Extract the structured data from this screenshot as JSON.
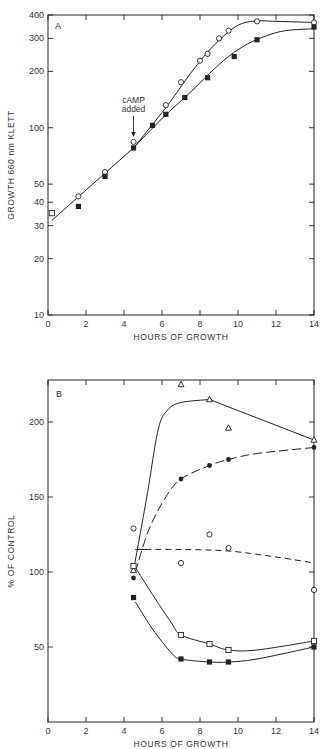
{
  "chart_data": [
    {
      "panel": "A",
      "type": "line",
      "title": "",
      "xlabel": "HOURS OF GROWTH",
      "ylabel": "GROWTH 660 nm KLETT",
      "yscale": "log",
      "xlim": [
        0,
        14
      ],
      "ylim": [
        10,
        400
      ],
      "x_ticks": [
        0,
        2,
        4,
        6,
        8,
        10,
        12,
        14
      ],
      "y_ticks": [
        10,
        20,
        30,
        40,
        50,
        100,
        200,
        300,
        400
      ],
      "grid": false,
      "annotations": [
        {
          "text": "cAMP added",
          "x": 4.5,
          "y": 84,
          "arrow": true
        }
      ],
      "series": [
        {
          "name": "open circles",
          "marker": "open-circle",
          "line": "solid",
          "points": [
            [
              1.6,
              43
            ],
            [
              3,
              58
            ],
            [
              4.5,
              84
            ],
            [
              6.2,
              132
            ],
            [
              7,
              175
            ],
            [
              8,
              228
            ],
            [
              8.4,
              248
            ],
            [
              9,
              300
            ],
            [
              9.5,
              330
            ],
            [
              11,
              370
            ],
            [
              14,
              365
            ]
          ]
        },
        {
          "name": "open square (initial)",
          "marker": "open-square",
          "line": "none",
          "points": [
            [
              0.2,
              35
            ]
          ]
        },
        {
          "name": "filled squares",
          "marker": "filled-square",
          "line": "solid",
          "points": [
            [
              1.6,
              38
            ],
            [
              3,
              55
            ],
            [
              4.5,
              78
            ],
            [
              5.5,
              103
            ],
            [
              6.2,
              118
            ],
            [
              7.2,
              145
            ],
            [
              8.4,
              185
            ],
            [
              9.8,
              240
            ],
            [
              11,
              295
            ],
            [
              14,
              345
            ]
          ]
        }
      ],
      "curves": {
        "shared_start": [
          [
            0.2,
            32
          ],
          [
            4.5,
            78
          ]
        ],
        "open_circles_fit": [
          [
            4.5,
            78
          ],
          [
            6.2,
            128
          ],
          [
            7.5,
            195
          ],
          [
            8.5,
            260
          ],
          [
            9.5,
            325
          ],
          [
            10.2,
            360
          ],
          [
            11,
            372
          ],
          [
            12,
            370
          ],
          [
            14,
            365
          ]
        ],
        "filled_squares_fit": [
          [
            4.5,
            78
          ],
          [
            6,
            112
          ],
          [
            7.5,
            155
          ],
          [
            8.5,
            195
          ],
          [
            9.5,
            240
          ],
          [
            10.5,
            280
          ],
          [
            11.5,
            310
          ],
          [
            12.5,
            330
          ],
          [
            14,
            338
          ]
        ]
      }
    },
    {
      "panel": "B",
      "type": "line",
      "title": "",
      "xlabel": "HOURS OF GROWTH",
      "ylabel": "% OF CONTROL",
      "yscale": "linear",
      "xlim": [
        0,
        14
      ],
      "ylim": [
        0,
        228
      ],
      "x_ticks": [
        0,
        2,
        4,
        6,
        8,
        10,
        12,
        14
      ],
      "y_ticks": [
        50,
        100,
        150,
        200
      ],
      "grid": false,
      "series": [
        {
          "name": "open triangles",
          "marker": "open-triangle",
          "line": "solid",
          "points": [
            [
              4.5,
              101
            ],
            [
              7,
              225
            ],
            [
              8.5,
              215
            ],
            [
              9.5,
              196
            ],
            [
              14,
              188
            ]
          ]
        },
        {
          "name": "filled circles",
          "marker": "filled-circle",
          "line": "long-dash",
          "points": [
            [
              4.5,
              96
            ],
            [
              7,
              162
            ],
            [
              8.5,
              171
            ],
            [
              9.5,
              175
            ],
            [
              14,
              183
            ]
          ]
        },
        {
          "name": "open circles",
          "marker": "open-circle",
          "line": "short-dash",
          "points": [
            [
              4.5,
              129
            ],
            [
              7,
              106
            ],
            [
              8.5,
              125
            ],
            [
              9.5,
              116
            ],
            [
              14,
              88
            ]
          ]
        },
        {
          "name": "open squares",
          "marker": "open-square",
          "line": "solid",
          "points": [
            [
              4.5,
              104
            ],
            [
              7,
              58
            ],
            [
              8.5,
              52
            ],
            [
              9.5,
              48
            ],
            [
              14,
              54
            ]
          ]
        },
        {
          "name": "filled squares",
          "marker": "filled-square",
          "line": "solid",
          "points": [
            [
              4.5,
              83
            ],
            [
              7,
              42
            ],
            [
              8.5,
              40
            ],
            [
              9.5,
              40
            ],
            [
              14,
              50
            ]
          ]
        }
      ],
      "curves": {
        "triangles_fit": [
          [
            4.5,
            101
          ],
          [
            5.2,
            150
          ],
          [
            5.8,
            195
          ],
          [
            6.3,
            208
          ],
          [
            7,
            213
          ],
          [
            8.5,
            215
          ],
          [
            14,
            188
          ]
        ],
        "filled_circles_fit": [
          [
            4.6,
            100
          ],
          [
            5.3,
            128
          ],
          [
            6.2,
            150
          ],
          [
            7,
            162
          ],
          [
            8.5,
            171
          ],
          [
            9.5,
            175
          ],
          [
            11,
            179
          ],
          [
            14,
            183
          ]
        ],
        "open_circles_fit": [
          [
            4.6,
            115
          ],
          [
            7,
            115
          ],
          [
            9.5,
            114
          ],
          [
            12,
            110
          ],
          [
            14,
            106
          ]
        ],
        "open_squares_fit": [
          [
            4.6,
            103
          ],
          [
            5.5,
            85
          ],
          [
            6.5,
            66
          ],
          [
            7,
            58
          ],
          [
            8.5,
            52
          ],
          [
            9.5,
            48
          ],
          [
            11,
            48
          ],
          [
            14,
            54
          ]
        ],
        "filled_squares_fit": [
          [
            4.6,
            80
          ],
          [
            5.5,
            62
          ],
          [
            6.5,
            46
          ],
          [
            7,
            42
          ],
          [
            8.5,
            40
          ],
          [
            9.5,
            40
          ],
          [
            11,
            42
          ],
          [
            14,
            50
          ]
        ]
      }
    }
  ],
  "panelA": {
    "label": "A",
    "xlabel": "HOURS OF GROWTH",
    "ylabel": "GROWTH 660 nm KLETT",
    "annotation_line1": "cAMP",
    "annotation_line2": "added"
  },
  "panelB": {
    "label": "B",
    "xlabel": "HOURS OF GROWTH",
    "ylabel": "% OF CONTROL"
  },
  "colors": {
    "ink": "#222222",
    "background": "#ffffff"
  }
}
